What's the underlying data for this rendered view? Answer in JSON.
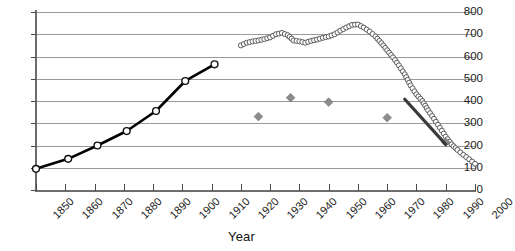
{
  "chart_data": {
    "type": "line",
    "title": "",
    "xlabel": "Year",
    "ylabel": "",
    "xlim": [
      1850,
      2000
    ],
    "ylim": [
      0,
      800
    ],
    "grid": true,
    "legend": "none",
    "x_ticks": [
      "1850",
      "1860",
      "1870",
      "1880",
      "1890",
      "1900",
      "1910",
      "1920",
      "1930",
      "1940",
      "1950",
      "1960",
      "1970",
      "1980",
      "1990",
      "2000"
    ],
    "y_ticks": [
      "0",
      "100",
      "200",
      "300",
      "400",
      "500",
      "600",
      "700",
      "800"
    ],
    "series": [
      {
        "name": "historic-black-line",
        "style": "line-with-open-circle-markers",
        "color": "#000000",
        "x": [
          1850,
          1861,
          1871,
          1881,
          1891,
          1901,
          1911
        ],
        "values": [
          95,
          140,
          200,
          265,
          355,
          490,
          565
        ]
      },
      {
        "name": "modern-open-circle-series",
        "style": "dense-open-circles",
        "color": "#5b5b5b",
        "x": [
          1920,
          1922,
          1924,
          1926,
          1928,
          1930,
          1932,
          1934,
          1936,
          1938,
          1940,
          1942,
          1944,
          1946,
          1948,
          1950,
          1952,
          1954,
          1956,
          1958,
          1960,
          1962,
          1964,
          1966,
          1968,
          1970,
          1972,
          1974,
          1976,
          1978,
          1980,
          1982,
          1984,
          1986,
          1988,
          1990,
          1992,
          1994,
          1996,
          1998,
          2000
        ],
        "values": [
          650,
          662,
          668,
          672,
          678,
          686,
          700,
          706,
          696,
          672,
          668,
          662,
          670,
          676,
          684,
          690,
          700,
          716,
          730,
          742,
          744,
          730,
          712,
          690,
          660,
          628,
          596,
          560,
          520,
          470,
          430,
          400,
          358,
          320,
          280,
          240,
          205,
          180,
          158,
          138,
          118
        ]
      },
      {
        "name": "gray-diamond-markers",
        "style": "diamond-markers",
        "color": "#8c8c8c",
        "x": [
          1926,
          1937,
          1950,
          1970,
          1990
        ],
        "values": [
          330,
          415,
          395,
          325,
          215
        ]
      },
      {
        "name": "decline-trend-segment",
        "style": "thick-line",
        "color": "#3a3a3a",
        "x": [
          1976,
          1990
        ],
        "values": [
          408,
          205
        ]
      }
    ]
  }
}
